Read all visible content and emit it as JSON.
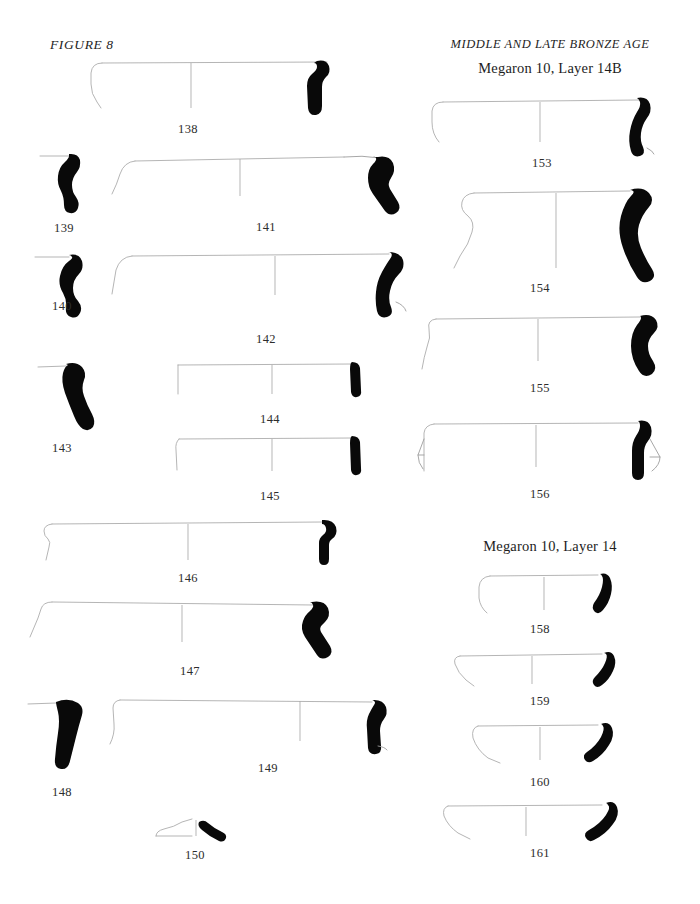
{
  "page": {
    "figure_label": "FIGURE 8",
    "running_head": "MIDDLE AND LATE BRONZE AGE",
    "width": 700,
    "height": 904,
    "background_color": "#ffffff",
    "line_color": "#adadad",
    "fill_color": "#090909",
    "text_color": "#1d1d1d"
  },
  "sections": [
    {
      "id": "layer-14b",
      "heading": "Megaron 10, Layer 14B"
    },
    {
      "id": "layer-14",
      "heading": "Megaron 10, Layer 14"
    }
  ],
  "catalog": {
    "left_column": [
      {
        "number": "138",
        "shape": "wide shallow bowl, everted hooked rim"
      },
      {
        "number": "139",
        "shape": "rim sherd, S-profile"
      },
      {
        "number": "141",
        "shape": "wide bowl, flaring wall, thickened rim"
      },
      {
        "number": "140",
        "shape": "rim sherd, S-profile"
      },
      {
        "number": "142",
        "shape": "wide bowl, rounded wall, tapered rim"
      },
      {
        "number": "143",
        "shape": "sloping wall sherd"
      },
      {
        "number": "144",
        "shape": "shallow straight-sided bowl"
      },
      {
        "number": "145",
        "shape": "shallow straight-sided bowl"
      },
      {
        "number": "146",
        "shape": "wide shallow bowl, knobbed rim"
      },
      {
        "number": "147",
        "shape": "wide bowl, carinated wall"
      },
      {
        "number": "148",
        "shape": "thick wedge-shaped wall sherd"
      },
      {
        "number": "149",
        "shape": "large deep basin, incurving wall"
      },
      {
        "number": "150",
        "shape": "low flat base / lid profile"
      }
    ],
    "right_column_14b": [
      {
        "number": "153",
        "shape": "wide bowl, rolled rim"
      },
      {
        "number": "154",
        "shape": "jar with S-curve neck, everted rim"
      },
      {
        "number": "155",
        "shape": "wide bowl, concave neck, thick rim"
      },
      {
        "number": "156",
        "shape": "bowl with triangular lug handle"
      }
    ],
    "right_column_14": [
      {
        "number": "158",
        "shape": "small deep cup, curving wall"
      },
      {
        "number": "159",
        "shape": "shallow flaring bowl"
      },
      {
        "number": "160",
        "shape": "shallow rounded bowl"
      },
      {
        "number": "161",
        "shape": "shallow open bowl, flaring rim"
      }
    ]
  },
  "labels": {
    "n138": "138",
    "n139": "139",
    "n140": "140",
    "n141": "141",
    "n142": "142",
    "n143": "143",
    "n144": "144",
    "n145": "145",
    "n146": "146",
    "n147": "147",
    "n148": "148",
    "n149": "149",
    "n150": "150",
    "n153": "153",
    "n154": "154",
    "n155": "155",
    "n156": "156",
    "n158": "158",
    "n159": "159",
    "n160": "160",
    "n161": "161"
  }
}
